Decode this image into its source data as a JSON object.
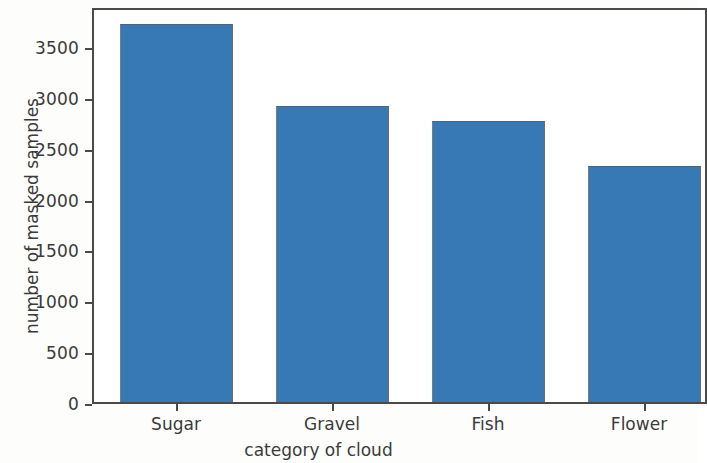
{
  "chart_data": {
    "type": "bar",
    "title": "",
    "xlabel": "category of cloud",
    "ylabel": "number of masked samples",
    "categories": [
      "Sugar",
      "Gravel",
      "Fish",
      "Flower"
    ],
    "values": [
      3716,
      2911,
      2763,
      2320
    ],
    "series": [
      {
        "name": "number of masked samples",
        "values": [
          3716,
          2911,
          2763,
          2320
        ]
      }
    ],
    "ylim": [
      0,
      3800
    ],
    "xlim_note": "rightmost bar is cropped by the figure edge",
    "yticks": [
      0,
      500,
      1000,
      1500,
      2000,
      2500,
      3000,
      3500
    ],
    "ytick_labels": [
      "0",
      "500",
      "1000",
      "1500",
      "2000",
      "2500",
      "3000",
      "3500"
    ],
    "xtick_labels": [
      "Sugar",
      "Gravel",
      "Fish",
      "Flower"
    ],
    "grid": false,
    "legend": false,
    "legend_position": "none",
    "bar_color": "#3679b4",
    "bar_edge_color": "#5f5f63",
    "axes_color": "#4a4a4a",
    "background_color": "#ffffff"
  }
}
